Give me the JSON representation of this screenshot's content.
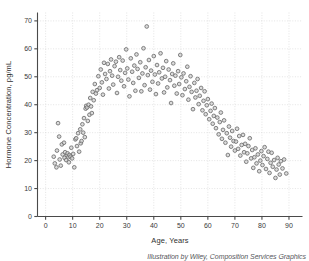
{
  "credit": "Illustration by Wiley, Composition Services Graphics",
  "colors": {
    "marker_stroke": "#6e6e6e",
    "marker_fill": "#cfcfcf",
    "axis": "#4a4a4a",
    "grid": "#d8d8d8",
    "text": "#3a3a3a"
  },
  "chart_data": {
    "type": "scatter",
    "title": "",
    "xlabel": "Age, Years",
    "ylabel": "Hormone Concentration, pg/mL",
    "xlim": [
      -3,
      95
    ],
    "ylim": [
      0,
      73
    ],
    "xticks": [
      0,
      10,
      20,
      30,
      40,
      50,
      60,
      70,
      80,
      90
    ],
    "yticks": [
      0,
      10,
      20,
      30,
      40,
      50,
      60,
      70
    ],
    "grid": true,
    "legend": "none",
    "marker": "open-circle",
    "series": [
      {
        "name": "Hormone concentration by age",
        "points": [
          [
            3.0,
            21.4
          ],
          [
            3.4,
            19.0
          ],
          [
            4.0,
            17.6
          ],
          [
            4.2,
            23.6
          ],
          [
            4.6,
            33.4
          ],
          [
            5.0,
            28.6
          ],
          [
            5.2,
            20.4
          ],
          [
            5.6,
            18.2
          ],
          [
            6.0,
            25.8
          ],
          [
            6.3,
            22.2
          ],
          [
            6.8,
            26.4
          ],
          [
            7.0,
            21.0
          ],
          [
            7.2,
            23.0
          ],
          [
            7.6,
            20.2
          ],
          [
            7.9,
            21.8
          ],
          [
            8.1,
            22.6
          ],
          [
            8.4,
            21.2
          ],
          [
            8.6,
            19.4
          ],
          [
            8.8,
            22.0
          ],
          [
            9.2,
            21.4
          ],
          [
            9.5,
            24.6
          ],
          [
            9.8,
            20.8
          ],
          [
            10.2,
            22.4
          ],
          [
            10.6,
            17.6
          ],
          [
            11.0,
            27.6
          ],
          [
            11.3,
            28.0
          ],
          [
            11.6,
            25.2
          ],
          [
            12.0,
            29.8
          ],
          [
            12.4,
            23.2
          ],
          [
            12.8,
            31.2
          ],
          [
            13.0,
            26.2
          ],
          [
            13.3,
            27.0
          ],
          [
            13.6,
            33.0
          ],
          [
            13.9,
            30.0
          ],
          [
            14.2,
            35.2
          ],
          [
            14.5,
            28.4
          ],
          [
            14.8,
            38.6
          ],
          [
            15.0,
            39.6
          ],
          [
            15.3,
            39.0
          ],
          [
            15.6,
            34.2
          ],
          [
            15.9,
            40.0
          ],
          [
            16.2,
            36.4
          ],
          [
            16.5,
            42.4
          ],
          [
            16.8,
            39.4
          ],
          [
            17.1,
            37.0
          ],
          [
            17.4,
            44.6
          ],
          [
            17.8,
            41.6
          ],
          [
            18.2,
            47.4
          ],
          [
            18.6,
            44.0
          ],
          [
            19.0,
            45.2
          ],
          [
            19.5,
            50.2
          ],
          [
            20.0,
            46.0
          ],
          [
            20.4,
            52.6
          ],
          [
            20.8,
            48.0
          ],
          [
            21.2,
            43.6
          ],
          [
            21.6,
            55.0
          ],
          [
            22.0,
            51.0
          ],
          [
            22.5,
            49.2
          ],
          [
            23.0,
            54.6
          ],
          [
            23.4,
            45.8
          ],
          [
            23.8,
            52.0
          ],
          [
            24.2,
            56.2
          ],
          [
            24.6,
            50.4
          ],
          [
            25.0,
            47.2
          ],
          [
            25.5,
            53.8
          ],
          [
            26.0,
            55.4
          ],
          [
            26.4,
            44.2
          ],
          [
            26.8,
            50.0
          ],
          [
            27.2,
            57.0
          ],
          [
            27.6,
            52.4
          ],
          [
            28.0,
            48.6
          ],
          [
            28.5,
            55.8
          ],
          [
            29.0,
            46.6
          ],
          [
            29.4,
            51.4
          ],
          [
            29.8,
            59.8
          ],
          [
            30.2,
            53.0
          ],
          [
            30.6,
            49.0
          ],
          [
            31.0,
            43.0
          ],
          [
            31.5,
            56.6
          ],
          [
            32.0,
            51.8
          ],
          [
            32.4,
            47.8
          ],
          [
            32.8,
            54.0
          ],
          [
            33.2,
            45.0
          ],
          [
            33.6,
            58.0
          ],
          [
            34.0,
            52.8
          ],
          [
            34.5,
            49.6
          ],
          [
            35.0,
            55.2
          ],
          [
            35.4,
            44.8
          ],
          [
            35.8,
            51.2
          ],
          [
            36.2,
            60.2
          ],
          [
            36.6,
            47.0
          ],
          [
            37.0,
            53.4
          ],
          [
            37.4,
            68.0
          ],
          [
            37.8,
            50.6
          ],
          [
            38.2,
            56.0
          ],
          [
            38.6,
            45.4
          ],
          [
            39.0,
            52.2
          ],
          [
            39.5,
            48.2
          ],
          [
            40.0,
            57.4
          ],
          [
            40.4,
            50.8
          ],
          [
            40.8,
            43.8
          ],
          [
            41.2,
            54.2
          ],
          [
            41.6,
            47.6
          ],
          [
            42.0,
            51.6
          ],
          [
            42.5,
            58.4
          ],
          [
            43.0,
            49.4
          ],
          [
            43.4,
            53.2
          ],
          [
            43.8,
            44.4
          ],
          [
            44.2,
            50.0
          ],
          [
            44.6,
            55.6
          ],
          [
            45.0,
            46.2
          ],
          [
            45.5,
            52.6
          ],
          [
            46.0,
            48.8
          ],
          [
            46.4,
            40.6
          ],
          [
            46.8,
            51.0
          ],
          [
            47.2,
            54.8
          ],
          [
            47.6,
            46.8
          ],
          [
            48.0,
            50.4
          ],
          [
            48.5,
            44.0
          ],
          [
            49.0,
            52.0
          ],
          [
            49.4,
            47.4
          ],
          [
            49.8,
            57.8
          ],
          [
            50.2,
            49.8
          ],
          [
            50.6,
            43.4
          ],
          [
            51.0,
            51.2
          ],
          [
            51.5,
            45.6
          ],
          [
            52.0,
            48.4
          ],
          [
            52.4,
            53.6
          ],
          [
            52.8,
            41.8
          ],
          [
            53.2,
            46.4
          ],
          [
            53.6,
            50.2
          ],
          [
            54.0,
            44.6
          ],
          [
            54.5,
            38.4
          ],
          [
            55.0,
            47.8
          ],
          [
            55.4,
            42.6
          ],
          [
            55.8,
            45.0
          ],
          [
            56.2,
            49.2
          ],
          [
            56.6,
            40.2
          ],
          [
            57.0,
            43.2
          ],
          [
            57.5,
            46.0
          ],
          [
            58.0,
            38.0
          ],
          [
            58.4,
            41.4
          ],
          [
            58.8,
            44.8
          ],
          [
            59.2,
            36.6
          ],
          [
            59.6,
            39.8
          ],
          [
            60.0,
            42.0
          ],
          [
            60.5,
            34.8
          ],
          [
            61.0,
            37.8
          ],
          [
            61.4,
            40.4
          ],
          [
            61.8,
            33.2
          ],
          [
            62.2,
            36.0
          ],
          [
            62.6,
            38.8
          ],
          [
            63.0,
            31.6
          ],
          [
            63.5,
            35.4
          ],
          [
            64.0,
            29.4
          ],
          [
            64.4,
            33.8
          ],
          [
            64.8,
            37.2
          ],
          [
            65.2,
            27.8
          ],
          [
            65.6,
            31.0
          ],
          [
            66.0,
            34.4
          ],
          [
            66.5,
            26.4
          ],
          [
            67.0,
            29.8
          ],
          [
            67.4,
            22.0
          ],
          [
            67.8,
            32.2
          ],
          [
            68.2,
            28.2
          ],
          [
            68.6,
            25.0
          ],
          [
            69.0,
            30.6
          ],
          [
            69.5,
            27.0
          ],
          [
            70.0,
            23.6
          ],
          [
            70.4,
            26.8
          ],
          [
            70.8,
            31.4
          ],
          [
            71.2,
            24.2
          ],
          [
            71.6,
            28.8
          ],
          [
            72.0,
            21.8
          ],
          [
            72.5,
            25.6
          ],
          [
            73.0,
            29.2
          ],
          [
            73.4,
            23.0
          ],
          [
            73.8,
            26.0
          ],
          [
            74.2,
            19.6
          ],
          [
            74.6,
            22.6
          ],
          [
            75.0,
            25.2
          ],
          [
            75.5,
            28.0
          ],
          [
            76.0,
            20.8
          ],
          [
            76.4,
            23.8
          ],
          [
            76.8,
            17.4
          ],
          [
            77.2,
            21.2
          ],
          [
            77.6,
            24.4
          ],
          [
            78.0,
            19.0
          ],
          [
            78.5,
            22.2
          ],
          [
            79.0,
            16.2
          ],
          [
            79.4,
            20.0
          ],
          [
            79.8,
            23.4
          ],
          [
            80.2,
            18.4
          ],
          [
            80.6,
            21.6
          ],
          [
            81.0,
            24.8
          ],
          [
            81.5,
            17.0
          ],
          [
            82.0,
            20.6
          ],
          [
            82.4,
            23.2
          ],
          [
            82.8,
            15.6
          ],
          [
            83.2,
            19.2
          ],
          [
            83.6,
            22.8
          ],
          [
            84.0,
            17.8
          ],
          [
            84.5,
            20.2
          ],
          [
            85.0,
            13.8
          ],
          [
            85.4,
            16.8
          ],
          [
            85.8,
            21.0
          ],
          [
            86.2,
            18.6
          ],
          [
            86.6,
            15.0
          ],
          [
            87.0,
            19.8
          ],
          [
            87.6,
            17.2
          ],
          [
            88.2,
            20.4
          ],
          [
            89.0,
            15.4
          ]
        ]
      }
    ]
  }
}
